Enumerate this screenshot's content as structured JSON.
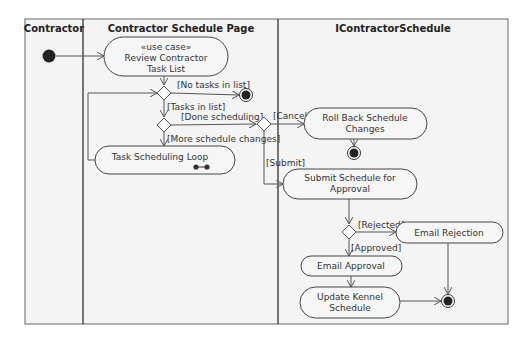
{
  "diagram": {
    "type": "UML activity diagram",
    "swimlanes": [
      {
        "id": "contractor",
        "title": "Contractor"
      },
      {
        "id": "schedule_page",
        "title": "Contractor Schedule Page"
      },
      {
        "id": "icontractor",
        "title": "IContractorSchedule"
      }
    ],
    "nodes": {
      "review": {
        "stereotype": "«use case»",
        "line1": "Review Contractor",
        "line2": "Task List"
      },
      "loop": {
        "label": "Task Scheduling Loop"
      },
      "rollback": {
        "line1": "Roll Back Schedule",
        "line2": "Changes"
      },
      "submit": {
        "line1": "Submit Schedule for",
        "line2": "Approval"
      },
      "email_rejection": {
        "label": "Email Rejection"
      },
      "email_approval": {
        "label": "Email Approval"
      },
      "update": {
        "line1": "Update Kennel",
        "line2": "Schedule"
      }
    },
    "guards": {
      "no_tasks": "[No tasks in list]",
      "tasks": "[Tasks in list]",
      "done": "[Done scheduling]",
      "more": "[More schedule changes]",
      "cancel": "[Cancel]",
      "submit": "[Submit]",
      "rejected": "[Rejected]",
      "approved": "[Approved]"
    },
    "colors": {
      "background": "#ffffff",
      "lane_fill": "#f4f4f4",
      "border": "#555555",
      "node_fill": "#f6f6f6",
      "initial_final": "#222222"
    }
  }
}
